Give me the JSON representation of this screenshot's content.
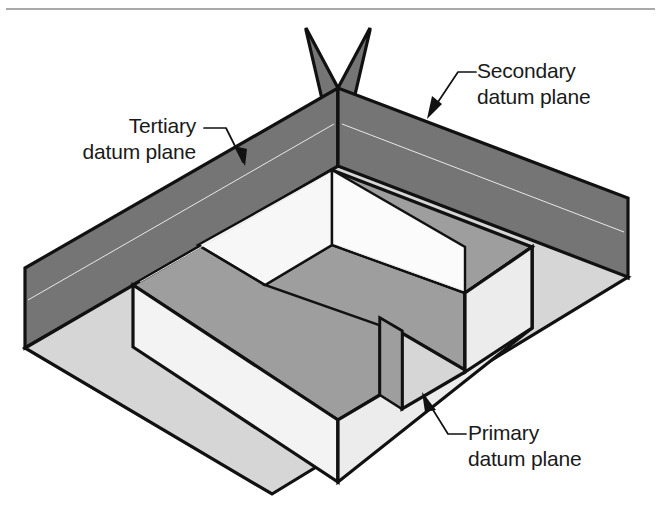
{
  "figure": {
    "background_color": "#ffffff",
    "top_rule_color": "#8d8d8d",
    "outline_color": "#111111"
  },
  "palette": {
    "plane_dark_gray": "#757575",
    "plane_medium_gray": "#9e9e9e",
    "base_light_gray": "#d6d6d6",
    "part_white": "#f3f3f3",
    "part_offwhite": "#ececec",
    "pocket_gray": "#9e9e9e"
  },
  "labels": [
    {
      "id": "tertiary",
      "name": "tertiary-datum-plane-label",
      "line1": "Tertiary",
      "line2": "datum plane",
      "anchor": "end",
      "x": 196,
      "y1": 133,
      "y2": 159
    },
    {
      "id": "secondary",
      "name": "secondary-datum-plane-label",
      "line1": "Secondary",
      "line2": "datum plane",
      "anchor": "start",
      "x": 477,
      "y1": 78,
      "y2": 104
    },
    {
      "id": "primary",
      "name": "primary-datum-plane-label",
      "line1": "Primary",
      "line2": "datum plane",
      "anchor": "start",
      "x": 468,
      "y1": 440,
      "y2": 466
    }
  ],
  "leaders": [
    {
      "id": "tertiary-leader",
      "name": "tertiary-leader-line",
      "path": "M 204 128 L 226 128 L 243 162",
      "arrow": "M 243 162 L 236 147 L 248 150 Z"
    },
    {
      "id": "secondary-leader",
      "name": "secondary-leader-line",
      "path": "M 474 72 L 458 72 L 431 113",
      "arrow": "M 431 113 L 437 97 L 446 105 Z"
    },
    {
      "id": "primary-leader",
      "name": "primary-leader-line",
      "path": "M 464 434 L 448 434 L 424 396",
      "arrow": "M 424 396 L 436 408 L 426 411 Z"
    }
  ],
  "geometry": {
    "note": "Isometric datum reference frame: horizontal primary plane with two vertical planes crossing at rear, and a notched block part resting on the primary plane.",
    "base_plane": "25,348 338,166 628,277 272,494",
    "secondary_plane_face": "338,166 628,277 628,196 338,86",
    "secondary_plane_fin": "338,86 338,166 366,28",
    "tertiary_plane_face": "25,348 338,166 338,86 25,268",
    "tertiary_plane_fin": "338,86 338,166 310,28"
  }
}
